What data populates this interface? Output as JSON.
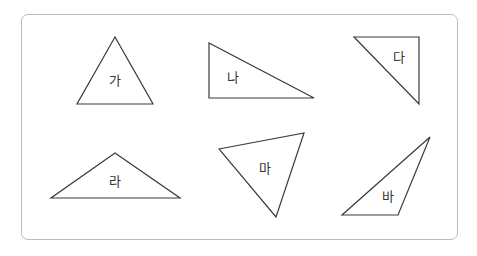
{
  "figure": {
    "colors": {
      "stroke": "#3a3a3a",
      "frame": "#bdbdbd",
      "text": "#333333",
      "background": "#ffffff"
    },
    "triangles": [
      {
        "label": "가",
        "points": "115,37 77,104 153,104",
        "label_pos": [
          115,
          81
        ]
      },
      {
        "label": "나",
        "points": "209,43 209,98 314,98",
        "label_pos": [
          233,
          78
        ]
      },
      {
        "label": "다",
        "points": "354,37 419,37 419,104",
        "label_pos": [
          399,
          58
        ]
      },
      {
        "label": "라",
        "points": "115,153 51,198 180,198",
        "label_pos": [
          115,
          182
        ]
      },
      {
        "label": "마",
        "points": "219,149 304,133 276,217",
        "label_pos": [
          265,
          169
        ]
      },
      {
        "label": "바",
        "points": "430,137 342,215 398,215",
        "label_pos": [
          388,
          197
        ]
      }
    ]
  }
}
